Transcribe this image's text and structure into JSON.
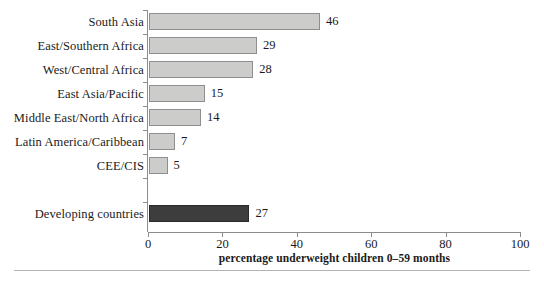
{
  "chart_data": {
    "type": "bar",
    "orientation": "horizontal",
    "title": "",
    "subtitle": "",
    "xlabel": "percentage underweight children 0–59 months",
    "ylabel": "",
    "xlim": [
      0,
      100
    ],
    "xticks": [
      0,
      20,
      40,
      60,
      80,
      100
    ],
    "xtick_labels": [
      "0",
      "20",
      "40",
      "60",
      "80",
      "100"
    ],
    "grid": false,
    "legend": null,
    "categories": [
      "South Asia",
      "East/Southern Africa",
      "West/Central Africa",
      "East Asia/Pacific",
      "Middle East/North Africa",
      "Latin America/Caribbean",
      "CEE/CIS",
      "Developing countries"
    ],
    "values": [
      46,
      29,
      28,
      15,
      14,
      7,
      5,
      27
    ],
    "value_labels": [
      "46",
      "29",
      "28",
      "15",
      "14",
      "7",
      "5",
      "27"
    ],
    "bars": [
      {
        "label": "South Asia",
        "value": 46,
        "value_label": "46",
        "style": "light",
        "slot": 0
      },
      {
        "label": "East/Southern Africa",
        "value": 29,
        "value_label": "29",
        "style": "light",
        "slot": 1
      },
      {
        "label": "West/Central Africa",
        "value": 28,
        "value_label": "28",
        "style": "light",
        "slot": 2
      },
      {
        "label": "East Asia/Pacific",
        "value": 15,
        "value_label": "15",
        "style": "light",
        "slot": 3
      },
      {
        "label": "Middle East/North Africa",
        "value": 14,
        "value_label": "14",
        "style": "light",
        "slot": 4
      },
      {
        "label": "Latin America/Caribbean",
        "value": 7,
        "value_label": "7",
        "style": "light",
        "slot": 5
      },
      {
        "label": "CEE/CIS",
        "value": 5,
        "value_label": "5",
        "style": "light",
        "slot": 6
      },
      {
        "label": "Developing countries",
        "value": 27,
        "value_label": "27",
        "style": "dark",
        "slot": 8
      }
    ],
    "colors": {
      "bar_light_fill": "#ccccca",
      "bar_light_stroke": "#8f8f8f",
      "bar_dark_fill": "#3d3d3d",
      "bar_dark_stroke": "#2a2a2a",
      "axis": "#8c8c8c",
      "text": "#1a1a1a",
      "background": "#ffffff",
      "footer_rule": "#b3b3b3"
    }
  }
}
